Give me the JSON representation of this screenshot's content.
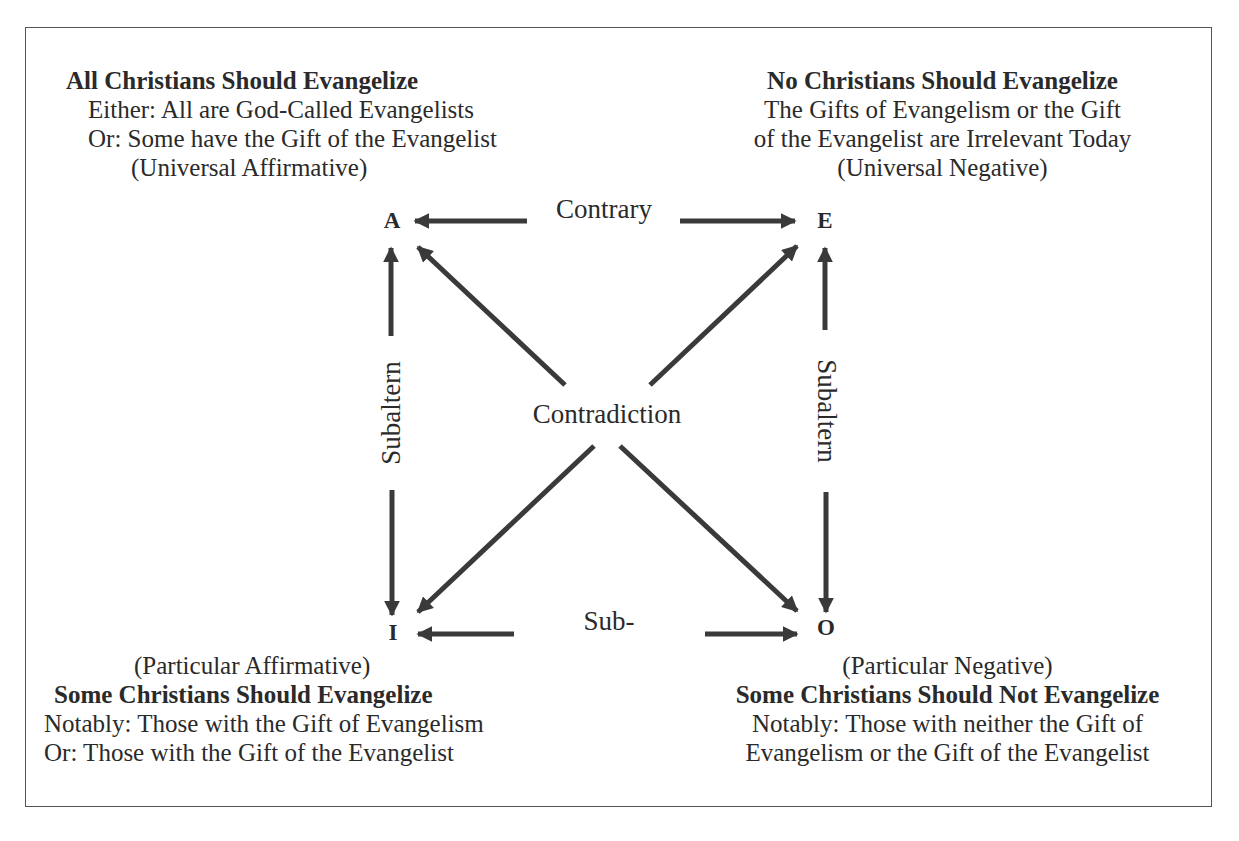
{
  "diagram": {
    "type": "square-of-opposition",
    "colors": {
      "arrow": "#3a3a3a",
      "text": "#2a2a2a",
      "border": "#555555",
      "background": "#ffffff"
    },
    "corners": {
      "A": {
        "letter": "A",
        "title": "All Christians Should Evangelize",
        "lines": [
          "Either: All are God-Called Evangelists",
          "Or: Some have the Gift of the Evangelist",
          "(Universal Affirmative)"
        ]
      },
      "E": {
        "letter": "E",
        "title": "No Christians Should Evangelize",
        "lines": [
          "The Gifts of Evangelism or the Gift",
          "of the Evangelist are Irrelevant Today",
          "(Universal Negative)"
        ]
      },
      "I": {
        "letter": "I",
        "category": "(Particular Affirmative)",
        "title": "Some Christians Should Evangelize",
        "lines": [
          "Notably: Those with the Gift of Evangelism",
          "Or: Those with the Gift of the Evangelist"
        ]
      },
      "O": {
        "letter": "O",
        "category": "(Particular Negative)",
        "title": "Some Christians Should Not Evangelize",
        "lines": [
          "Notably: Those with neither the Gift of",
          "Evangelism or the Gift of the Evangelist"
        ]
      }
    },
    "relations": {
      "top": "Contrary",
      "bottom": "Sub-",
      "center": "Contradiction",
      "left": "Subaltern",
      "right": "Subaltern"
    }
  }
}
